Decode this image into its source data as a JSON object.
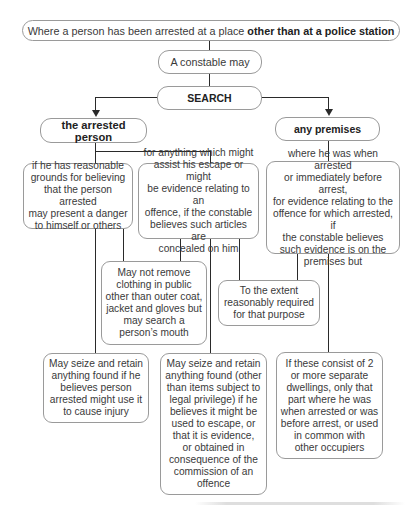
{
  "diagram": {
    "root": {
      "prefix": "Where a person has been arrested at a place ",
      "emphasis": "other than at a police station"
    },
    "step": "A constable may",
    "action": "SEARCH",
    "branches": [
      {
        "label": "the arrested person",
        "children": [
          {
            "text": "if he has reasonable grounds for believing that the person arrested may present a danger to himself or others",
            "lines": [
              "if he has reasonable",
              "grounds for believing",
              "that the person arrested",
              "may present a danger",
              "to himself or others"
            ]
          },
          {
            "text": "for anything which might assist his escape or might be evidence relating to an offence, if the constable believes such articles are concealed on him",
            "lines": [
              "for anything which might",
              "assist his escape or might",
              "be evidence relating to an",
              "offence, if the constable",
              "believes such articles are",
              "concealed on him"
            ]
          }
        ]
      },
      {
        "label": "any premises",
        "children": [
          {
            "text": "where he was when arrested or immediately before arrest, for evidence relating to the offence for which arrested, if the constable believes such evidence is on the premises but",
            "lines": [
              "where he was when arrested",
              "or immediately before arrest,",
              "for evidence relating to the",
              "offence for which arrested, if",
              "the constable believes",
              "such evidence is on the",
              "premises but"
            ]
          }
        ]
      }
    ],
    "outcomes": {
      "no_remove_clothing": {
        "lines": [
          "May not remove",
          "clothing in public",
          "other than outer coat,",
          "jacket and gloves but",
          "may search a",
          "person’s mouth"
        ]
      },
      "extent_required": {
        "lines": [
          "To the extent",
          "reasonably required",
          "for that purpose"
        ]
      },
      "seize_injury": {
        "lines": [
          "May seize and retain",
          "anything found if he",
          "believes person",
          "arrested might use it",
          "to cause injury"
        ]
      },
      "seize_evidence": {
        "lines": [
          "May seize and retain",
          "anything found (other",
          "than items subject to",
          "legal privilege) if he",
          "believes it might be",
          "used to escape, or",
          "that it is evidence,",
          "or obtained in",
          "consequence of the",
          "commission of an",
          "offence"
        ]
      },
      "separate_dwellings": {
        "lines": [
          "If these consist of 2",
          "or more separate",
          "dwellings, only that",
          "part where he was",
          "when arrested or was",
          "before arrest, or used",
          "in common with",
          "other occupiers"
        ]
      }
    },
    "colors": {
      "line": "#2a2a2a",
      "box_border": "#9a9a9a",
      "text": "#3a3a3a",
      "background": "#ffffff"
    }
  }
}
